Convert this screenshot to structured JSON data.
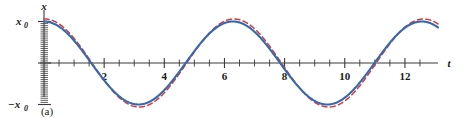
{
  "figure": {
    "caption": "(a)",
    "x_axis_label": "t",
    "y_axis_label": "x",
    "y_tick_labels": {
      "positive": "x0",
      "positive_display": "x",
      "positive_sub": "0",
      "negative_display": "−x",
      "negative_sub": "0"
    },
    "x_tick_labels": [
      "2",
      "4",
      "6",
      "8",
      "10",
      "12"
    ]
  },
  "colors": {
    "solid_curve": "#3568ae",
    "dashed_curve": "#d33b3b",
    "axis": "#3a3a3a",
    "text": "#1a1a1a",
    "background": "#ffffff"
  },
  "chart_data": {
    "type": "line",
    "title": "",
    "subtitle": "",
    "xlabel": "t",
    "ylabel": "x",
    "caption": "(a)",
    "xlim": [
      0,
      13.1
    ],
    "ylim": [
      -1.28,
      1.28
    ],
    "grid": false,
    "legend": "none",
    "xticks": [
      0,
      0.5,
      1,
      1.5,
      2,
      2.5,
      3,
      3.5,
      4,
      4.5,
      5,
      5.5,
      6,
      6.5,
      7,
      7.5,
      8,
      8.5,
      9,
      9.5,
      10,
      10.5,
      11,
      11.5,
      12,
      12.5
    ],
    "xtick_labels": [
      {
        "value": 2,
        "label": "2"
      },
      {
        "value": 4,
        "label": "4"
      },
      {
        "value": 6,
        "label": "6"
      },
      {
        "value": 8,
        "label": "8"
      },
      {
        "value": 10,
        "label": "10"
      },
      {
        "value": 12,
        "label": "12"
      }
    ],
    "yticks": [
      -1,
      0,
      1
    ],
    "ytick_labels": [
      {
        "value": 1,
        "label": "x0"
      },
      {
        "value": 0,
        "label": ""
      },
      {
        "value": -1,
        "label": "-x0"
      }
    ],
    "series": [
      {
        "name": "solid-blue-oscillation",
        "style": "solid",
        "color": "#3568ae",
        "amplitude": 1.0,
        "period": 6.28,
        "phase": 0.0,
        "formula": "x = x0 * cos(2*pi*t/6.28)",
        "x": [
          0,
          0.25,
          0.5,
          0.75,
          1,
          1.25,
          1.5,
          1.75,
          2,
          2.25,
          2.5,
          2.75,
          3,
          3.25,
          3.5,
          3.75,
          4,
          4.25,
          4.5,
          4.75,
          5,
          5.25,
          5.5,
          5.75,
          6,
          6.25,
          6.5,
          6.75,
          7,
          7.25,
          7.5,
          7.75,
          8,
          8.25,
          8.5,
          8.75,
          9,
          9.25,
          9.5,
          9.75,
          10,
          10.25,
          10.5,
          10.75,
          11,
          11.25,
          11.5,
          11.75,
          12,
          12.25,
          12.5,
          12.75,
          13
        ],
        "y": [
          1.0,
          0.969,
          0.878,
          0.732,
          0.54,
          0.316,
          0.071,
          -0.18,
          -0.416,
          -0.628,
          -0.801,
          -0.925,
          -0.99,
          -0.993,
          -0.934,
          -0.815,
          -0.654,
          -0.454,
          -0.228,
          0.024,
          0.284,
          0.522,
          0.725,
          0.881,
          0.97,
          0.999,
          0.96,
          0.858,
          0.703,
          0.507,
          0.285,
          0.035,
          -0.214,
          -0.447,
          -0.651,
          -0.817,
          -0.933,
          -0.992,
          -0.99,
          -0.927,
          -0.804,
          -0.632,
          -0.421,
          -0.186,
          0.066,
          0.312,
          0.537,
          0.73,
          0.877,
          0.968,
          1.0,
          0.971,
          0.884
        ]
      },
      {
        "name": "dashed-red-oscillation",
        "style": "dashed",
        "color": "#d33b3b",
        "amplitude": 1.06,
        "period": 6.3,
        "phase": 0.02,
        "formula": "x = 1.06*x0 * cos(2*pi*(t-0.02)/6.30)",
        "x": [
          0,
          0.25,
          0.5,
          0.75,
          1,
          1.25,
          1.5,
          1.75,
          2,
          2.25,
          2.5,
          2.75,
          3,
          3.25,
          3.5,
          3.75,
          4,
          4.25,
          4.5,
          4.75,
          5,
          5.25,
          5.5,
          5.75,
          6,
          6.25,
          6.5,
          6.75,
          7,
          7.25,
          7.5,
          7.75,
          8,
          8.25,
          8.5,
          8.75,
          9,
          9.25,
          9.5,
          9.75,
          10,
          10.25,
          10.5,
          10.75,
          11,
          11.25,
          11.5,
          11.75,
          12,
          12.25,
          12.5,
          12.75,
          13
        ],
        "y": [
          1.06,
          1.031,
          0.94,
          0.789,
          0.587,
          0.349,
          0.09,
          -0.177,
          -0.429,
          -0.654,
          -0.84,
          -0.973,
          -1.043,
          -1.046,
          -0.984,
          -0.857,
          -0.682,
          -0.468,
          -0.228,
          0.028,
          0.303,
          0.559,
          0.777,
          0.942,
          1.037,
          1.057,
          1.018,
          0.912,
          0.746,
          0.535,
          0.297,
          0.035,
          -0.22,
          -0.468,
          -0.69,
          -0.871,
          -0.993,
          -1.053,
          -1.047,
          -0.977,
          -0.845,
          -0.66,
          -0.436,
          -0.187,
          0.077,
          0.338,
          0.578,
          0.783,
          0.939,
          1.034,
          1.06,
          1.032,
          0.942
        ]
      }
    ]
  }
}
